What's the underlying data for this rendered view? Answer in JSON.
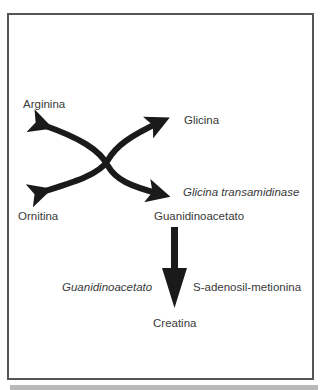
{
  "diagram": {
    "type": "biochemical-pathway",
    "nodes": {
      "arginina": "Arginina",
      "glicina": "Glicina",
      "ornitina": "Ornitina",
      "glicina_transamidinase": "Glicina transamidinase",
      "guanidinoacetato": "Guanidinoacetato",
      "guanidinoacetato_enzyme": "Guanidinoacetato",
      "s_adenosil_metionina": "S-adenosil-metionina",
      "creatina": "Creatina"
    },
    "edges": [
      {
        "from": "Arginina + Glicina",
        "to": "Ornitina + Guanidinoacetato",
        "enzyme": "Glicina transamidinase",
        "style": "crossed-curved-arrows"
      },
      {
        "from": "Guanidinoacetato",
        "to": "Creatina",
        "enzyme": "Guanidinoacetato",
        "cofactor": "S-adenosil-metionina",
        "style": "straight-down-arrow"
      }
    ],
    "colors": {
      "arrow": "#1a1a1a",
      "text": "#3a3a3a",
      "frame": "#555555",
      "bottom_bar": "#b8b8b8"
    }
  }
}
